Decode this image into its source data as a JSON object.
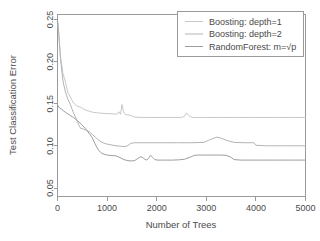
{
  "chart_data": {
    "type": "line",
    "title": "",
    "xlabel": "Number of Trees",
    "ylabel": "Test Classification Error",
    "xlim": [
      0,
      5000
    ],
    "ylim": [
      0.04,
      0.256
    ],
    "grid": false,
    "legend_position": "top-right",
    "xticks": [
      0,
      1000,
      2000,
      3000,
      4000,
      5000
    ],
    "xtick_labels": [
      "0",
      "1000",
      "2000",
      "3000",
      "4000",
      "5000"
    ],
    "yticks": [
      0.05,
      0.1,
      0.15,
      0.2,
      0.25
    ],
    "ytick_labels": [
      "0.05",
      "0.10",
      "0.15",
      "0.20",
      "0.25"
    ],
    "series": [
      {
        "name": "Boosting: depth=1",
        "color": "#c8c8c8",
        "x": [
          10,
          60,
          110,
          160,
          210,
          260,
          310,
          360,
          410,
          470,
          520,
          570,
          620,
          680,
          730,
          790,
          840,
          900,
          960,
          1020,
          1080,
          1140,
          1200,
          1240,
          1270,
          1300,
          1330,
          1370,
          1420,
          1480,
          1560,
          1700,
          1900,
          2100,
          2300,
          2500,
          2560,
          2600,
          2660,
          2720,
          2900,
          3200,
          3600,
          4000,
          4400,
          4800,
          5000
        ],
        "y": [
          0.245,
          0.206,
          0.186,
          0.176,
          0.163,
          0.158,
          0.152,
          0.149,
          0.147,
          0.146,
          0.144,
          0.1425,
          0.1415,
          0.1405,
          0.1398,
          0.1395,
          0.139,
          0.1388,
          0.1385,
          0.1383,
          0.1382,
          0.138,
          0.1378,
          0.1405,
          0.1375,
          0.1492,
          0.1408,
          0.1372,
          0.1368,
          0.1362,
          0.1342,
          0.1338,
          0.1338,
          0.1338,
          0.1338,
          0.1338,
          0.1352,
          0.1392,
          0.1352,
          0.1338,
          0.1338,
          0.1338,
          0.1338,
          0.1338,
          0.1338,
          0.1338,
          0.1338
        ]
      },
      {
        "name": "Boosting: depth=2",
        "color": "#b4b4b4",
        "x": [
          10,
          60,
          110,
          160,
          210,
          260,
          320,
          380,
          440,
          470,
          520,
          580,
          640,
          700,
          760,
          820,
          880,
          940,
          1000,
          1060,
          1120,
          1180,
          1240,
          1300,
          1360,
          1420,
          1480,
          1560,
          1660,
          1800,
          2000,
          2200,
          2400,
          2700,
          2950,
          3050,
          3150,
          3220,
          3300,
          3400,
          3560,
          3760,
          3960,
          4000,
          4200,
          4600,
          5000
        ],
        "y": [
          0.246,
          0.204,
          0.177,
          0.164,
          0.1555,
          0.149,
          0.1395,
          0.1318,
          0.1238,
          0.1206,
          0.1202,
          0.1188,
          0.1168,
          0.1138,
          0.1105,
          0.1075,
          0.1048,
          0.1032,
          0.1022,
          0.1015,
          0.1008,
          0.1002,
          0.0998,
          0.0995,
          0.0992,
          0.1005,
          0.1032,
          0.1038,
          0.1038,
          0.1038,
          0.1038,
          0.1038,
          0.1038,
          0.1038,
          0.1042,
          0.1068,
          0.1092,
          0.1105,
          0.1092,
          0.1068,
          0.1042,
          0.1038,
          0.1038,
          0.1008,
          0.1002,
          0.1002,
          0.1002
        ]
      },
      {
        "name": "RandomForest: m=√p",
        "color": "#9e9e9e",
        "x": [
          10,
          40,
          80,
          130,
          190,
          250,
          320,
          400,
          480,
          560,
          640,
          700,
          760,
          800,
          840,
          880,
          920,
          960,
          1000,
          1060,
          1120,
          1180,
          1260,
          1340,
          1420,
          1500,
          1560,
          1620,
          1680,
          1720,
          1760,
          1800,
          1840,
          1880,
          1920,
          1960,
          2020,
          2100,
          2200,
          2320,
          2440,
          2560,
          2680,
          2760,
          2840,
          2920,
          3000,
          3100,
          3200,
          3300,
          3400,
          3480,
          3560,
          3700,
          3900,
          4100,
          4400,
          4700,
          5000
        ],
        "y": [
          0.148,
          0.1452,
          0.1438,
          0.1412,
          0.1388,
          0.1365,
          0.1338,
          0.1302,
          0.1258,
          0.1208,
          0.1148,
          0.1098,
          0.1022,
          0.0975,
          0.0942,
          0.0918,
          0.0905,
          0.0898,
          0.0892,
          0.0888,
          0.0885,
          0.0882,
          0.0862,
          0.0838,
          0.0825,
          0.0822,
          0.0828,
          0.0852,
          0.0872,
          0.0862,
          0.0842,
          0.0832,
          0.0858,
          0.0888,
          0.0862,
          0.0838,
          0.0832,
          0.0832,
          0.0832,
          0.0832,
          0.0835,
          0.0842,
          0.0868,
          0.0888,
          0.0892,
          0.0892,
          0.0892,
          0.0892,
          0.0892,
          0.0892,
          0.0888,
          0.0872,
          0.0838,
          0.0832,
          0.0832,
          0.0832,
          0.0832,
          0.0832,
          0.0832
        ]
      }
    ]
  },
  "axes": {
    "x_title": "Number of Trees",
    "y_title": "Test Classification Error",
    "x_labels": [
      "0",
      "1000",
      "2000",
      "3000",
      "4000",
      "5000"
    ],
    "y_labels": [
      "0.05",
      "0.10",
      "0.15",
      "0.20",
      "0.25"
    ]
  },
  "legend": {
    "items": [
      {
        "label": "Boosting: depth=1",
        "color": "#c8c8c8"
      },
      {
        "label": "Boosting: depth=2",
        "color": "#b4b4b4"
      },
      {
        "label": "RandomForest: m=√p",
        "color": "#9e9e9e"
      }
    ]
  }
}
